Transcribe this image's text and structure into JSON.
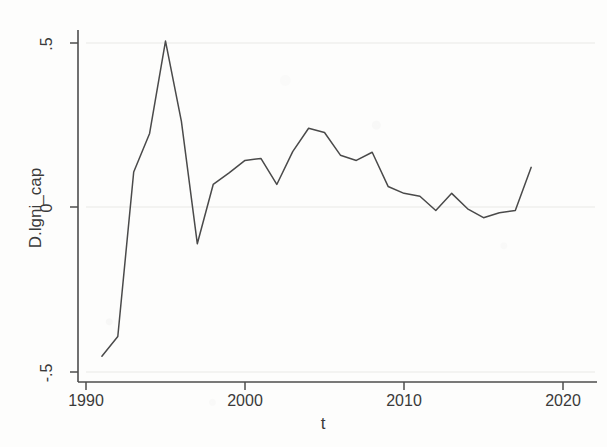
{
  "chart_data": {
    "type": "line",
    "title": "",
    "subtitle": "",
    "xlabel": "t",
    "ylabel": "D.lgni_cap",
    "xlim": [
      1990,
      2020
    ],
    "ylim": [
      -0.5,
      0.5
    ],
    "xticks": [
      "1990",
      "2000",
      "2010",
      "2020"
    ],
    "xtick_values": [
      1990,
      2000,
      2010,
      2020
    ],
    "yticks": [
      ".5",
      "0",
      "-.5"
    ],
    "ytick_values": [
      0.5,
      0,
      -0.5
    ],
    "grid": "horizontal-light",
    "legend": "none",
    "line_color": "#4a4a4a",
    "background_color": "#fdfdfc",
    "series": [
      {
        "name": "D.lgni_cap",
        "x": [
          1991,
          1992,
          1993,
          1994,
          1995,
          1996,
          1997,
          1998,
          1999,
          2000,
          2001,
          2002,
          2003,
          2004,
          2005,
          2006,
          2007,
          2008,
          2009,
          2010,
          2011,
          2012,
          2013,
          2014,
          2015,
          2016,
          2017,
          2018
        ],
        "values": [
          -0.452,
          -0.392,
          0.108,
          0.225,
          0.506,
          0.262,
          -0.11,
          0.07,
          0.105,
          0.143,
          0.149,
          0.07,
          0.17,
          0.241,
          0.228,
          0.159,
          0.143,
          0.168,
          0.064,
          0.043,
          0.034,
          -0.009,
          0.043,
          -0.004,
          -0.031,
          -0.016,
          -0.009,
          0.122
        ]
      }
    ]
  },
  "axes": {
    "y_label": "D.lgni_cap",
    "x_label": "t",
    "y_tick_labels": [
      ".5",
      "0",
      "-.5"
    ],
    "x_tick_labels": [
      "1990",
      "2000",
      "2010",
      "2020"
    ]
  }
}
